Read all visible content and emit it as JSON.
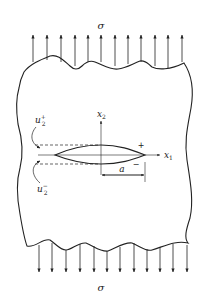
{
  "figure": {
    "type": "crack-in-plate-under-tension",
    "labels": {
      "stress_top": "σ",
      "stress_bottom": "σ",
      "axis_x1_base": "x",
      "axis_x1_sub": "1",
      "axis_x2_base": "x",
      "axis_x2_sub": "2",
      "u_plus_base": "u",
      "u_plus_sub": "2",
      "u_plus_sup": "+",
      "u_minus_base": "u",
      "u_minus_sub": "2",
      "u_minus_sup": "−",
      "half_length": "a",
      "upper_face_sign": "+",
      "lower_face_sign": "−"
    },
    "arrows_top_count": 12,
    "arrows_bottom_count": 12,
    "colors": {
      "stroke": "#222222",
      "background": "#ffffff"
    }
  }
}
